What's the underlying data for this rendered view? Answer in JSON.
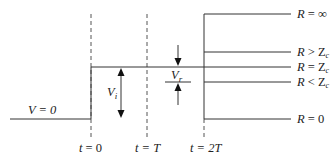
{
  "diagram": {
    "initial_label": "V = 0",
    "incident_label": "V",
    "incident_sub": "i",
    "reflected_label": "V",
    "reflected_sub": "r",
    "time_markers": [
      {
        "label_t": "t",
        "label_rest": " = 0"
      },
      {
        "label_t": "t",
        "label_rest": " = T"
      },
      {
        "label_t": "t",
        "label_rest": " = 2T"
      }
    ],
    "load_cases": [
      {
        "r": "R",
        "rel": " = ",
        "z": "∞",
        "zsub": ""
      },
      {
        "r": "R",
        "rel": " > ",
        "z": "Z",
        "zsub": "c"
      },
      {
        "r": "R",
        "rel": " = ",
        "z": "Z",
        "zsub": "c"
      },
      {
        "r": "R",
        "rel": " < ",
        "z": "Z",
        "zsub": "c"
      },
      {
        "r": "R",
        "rel": " = ",
        "z": "0",
        "zsub": ""
      }
    ],
    "colors": {
      "line": "#333333",
      "text": "#222222",
      "background": "#ffffff"
    }
  }
}
